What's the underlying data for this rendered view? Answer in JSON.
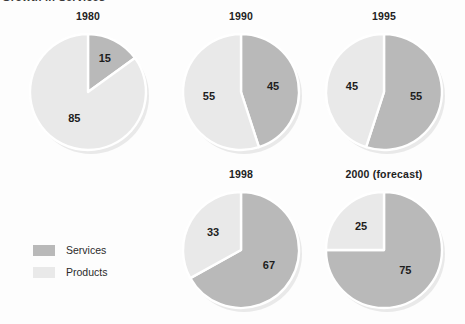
{
  "chart_title": "Growth in Services",
  "colors": {
    "services": "#b9b9b9",
    "products": "#e9e9e9",
    "separator": "#ffffff",
    "shadow": "#d9d9d9",
    "label_text": "#1d1d1d",
    "background": "#fdfdfd"
  },
  "legend": {
    "items": [
      {
        "label": "Services",
        "color": "#b9b9b9",
        "key": "services"
      },
      {
        "label": "Products",
        "color": "#e9e9e9",
        "key": "products"
      }
    ]
  },
  "chart_data": {
    "type": "pie",
    "title": "Growth in Services",
    "legend": [
      "Services",
      "Products"
    ],
    "legend_position": "left-middle",
    "units": "percent",
    "grid": false,
    "charts": [
      {
        "title": "1980",
        "categories": [
          "Services",
          "Products"
        ],
        "values": [
          15,
          85
        ],
        "labels": [
          "15",
          "85"
        ],
        "slices": [
          {
            "name": "Services",
            "value": 15,
            "label": "15",
            "color": "#b9b9b9",
            "start_deg": 0,
            "end_deg": 54
          },
          {
            "name": "Products",
            "value": 85,
            "label": "85",
            "color": "#e9e9e9",
            "start_deg": 54,
            "end_deg": 360
          }
        ]
      },
      {
        "title": "1990",
        "categories": [
          "Services",
          "Products"
        ],
        "values": [
          45,
          55
        ],
        "labels": [
          "45",
          "55"
        ],
        "slices": [
          {
            "name": "Services",
            "value": 45,
            "label": "45",
            "color": "#b9b9b9",
            "start_deg": 0,
            "end_deg": 162
          },
          {
            "name": "Products",
            "value": 55,
            "label": "55",
            "color": "#e9e9e9",
            "start_deg": 162,
            "end_deg": 360
          }
        ]
      },
      {
        "title": "1995",
        "categories": [
          "Services",
          "Products"
        ],
        "values": [
          55,
          45
        ],
        "labels": [
          "55",
          "45"
        ],
        "slices": [
          {
            "name": "Services",
            "value": 55,
            "label": "55",
            "color": "#b9b9b9",
            "start_deg": 0,
            "end_deg": 198
          },
          {
            "name": "Products",
            "value": 45,
            "label": "45",
            "color": "#e9e9e9",
            "start_deg": 198,
            "end_deg": 360
          }
        ]
      },
      {
        "title": "1998",
        "categories": [
          "Services",
          "Products"
        ],
        "values": [
          67,
          33
        ],
        "labels": [
          "67",
          "33"
        ],
        "slices": [
          {
            "name": "Services",
            "value": 67,
            "label": "67",
            "color": "#b9b9b9",
            "start_deg": 0,
            "end_deg": 241
          },
          {
            "name": "Products",
            "value": 33,
            "label": "33",
            "color": "#e9e9e9",
            "start_deg": 241,
            "end_deg": 360
          }
        ]
      },
      {
        "title": "2000 (forecast)",
        "categories": [
          "Services",
          "Products"
        ],
        "values": [
          75,
          25
        ],
        "labels": [
          "75",
          "25"
        ],
        "slices": [
          {
            "name": "Services",
            "value": 75,
            "label": "75",
            "color": "#b9b9b9",
            "start_deg": 0,
            "end_deg": 270
          },
          {
            "name": "Products",
            "value": 25,
            "label": "25",
            "color": "#e9e9e9",
            "start_deg": 270,
            "end_deg": 360
          }
        ]
      }
    ]
  },
  "layout": {
    "pies": [
      {
        "index": 0,
        "left": 22,
        "top": 10,
        "width": 132,
        "radius": 58,
        "caption_gap": 20
      },
      {
        "index": 1,
        "left": 175,
        "top": 10,
        "width": 132,
        "radius": 58,
        "caption_gap": 20
      },
      {
        "index": 2,
        "left": 318,
        "top": 10,
        "width": 132,
        "radius": 58,
        "caption_gap": 20
      },
      {
        "index": 3,
        "left": 175,
        "top": 168,
        "width": 132,
        "radius": 58,
        "caption_gap": 20
      },
      {
        "index": 4,
        "left": 318,
        "top": 168,
        "width": 132,
        "radius": 58,
        "caption_gap": 20
      }
    ]
  }
}
